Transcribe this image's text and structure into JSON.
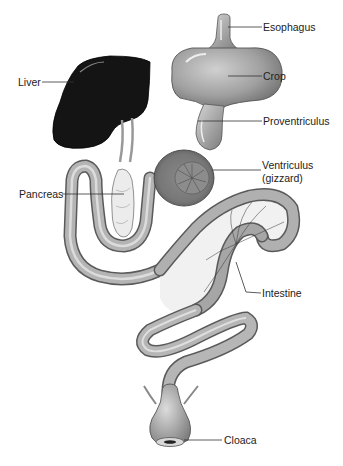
{
  "figure": {
    "labels": {
      "esophagus": "Esophagus",
      "crop": "Crop",
      "liver": "Liver",
      "proventriculus": "Proventriculus",
      "ventriculus": "Ventriculus",
      "ventriculus_alt": "(gizzard)",
      "pancreas": "Pancreas",
      "intestine": "Intestine",
      "cloaca": "Cloaca"
    },
    "colors": {
      "liver": "#111111",
      "organ_gray": "#9a9a9a",
      "organ_light": "#c8c8c8",
      "outline": "#444444",
      "pancreas": "#e8e8e8",
      "mesentery": "#eeeeee"
    }
  }
}
